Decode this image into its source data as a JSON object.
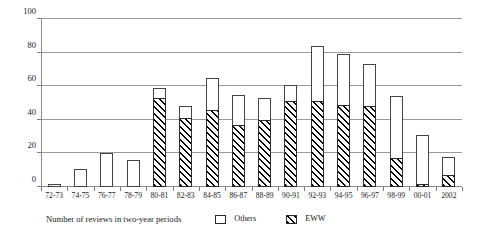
{
  "chart_data": {
    "type": "bar",
    "title": "",
    "subtitle": "",
    "xlabel": "Number of reviews in two-year periods",
    "ylabel": "",
    "stacked": true,
    "grid": true,
    "legend_position": "bottom",
    "ylim": [
      0,
      100
    ],
    "yticks": [
      0,
      20,
      40,
      60,
      80,
      100
    ],
    "ytick_labels": [
      "0",
      "20",
      "40",
      "60",
      "80",
      "100"
    ],
    "categories": [
      "72-73",
      "74-75",
      "76-77",
      "78-79",
      "80-81",
      "82-83",
      "84-85",
      "86-87",
      "88-89",
      "90-91",
      "92-93",
      "94-95",
      "96-97",
      "98-99",
      "00-01",
      "2002"
    ],
    "series": [
      {
        "name": "EWW",
        "style": "hatched",
        "values": [
          0,
          0,
          0,
          0,
          53,
          41,
          46,
          37,
          40,
          51,
          51,
          49,
          48,
          17,
          2,
          7
        ]
      },
      {
        "name": "Others",
        "style": "white",
        "values": [
          2,
          11,
          20,
          16,
          6,
          7,
          19,
          18,
          13,
          10,
          33,
          30,
          25,
          37,
          29,
          11
        ]
      }
    ],
    "totals": [
      2,
      11,
      20,
      16,
      59,
      48,
      65,
      55,
      53,
      61,
      84,
      79,
      73,
      54,
      31,
      18
    ]
  },
  "legend": {
    "caption": "Number of reviews in two-year periods",
    "entries": [
      {
        "label": "Others",
        "style": "white"
      },
      {
        "label": "EWW",
        "style": "hatched"
      }
    ]
  },
  "colors": {
    "hatch": "#000000",
    "bar_fill": "#ffffff",
    "bar_stroke": "#2a2a2a",
    "gridline": "#9a9a9a",
    "axis": "#8a8a8a",
    "text": "#1a1a1a",
    "background": "#ffffff"
  }
}
